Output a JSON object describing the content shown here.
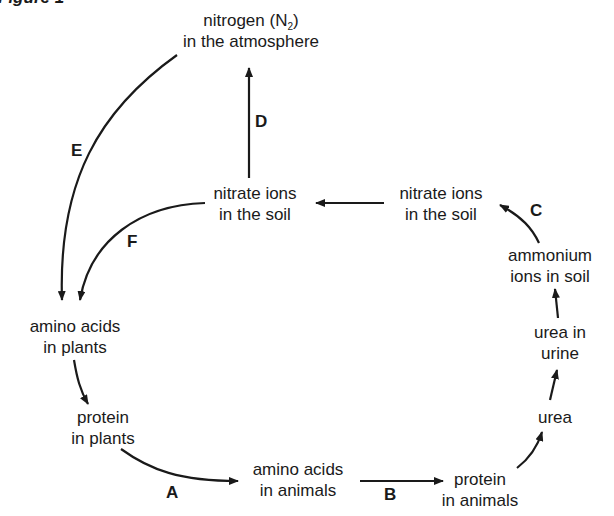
{
  "figure_title": "Figure 1",
  "nodes": {
    "nitrogen_l1": "nitrogen (N",
    "nitrogen_sub": "2",
    "nitrogen_close": ")",
    "nitrogen_l2": "in the atmosphere",
    "nitrate_left_l1": "nitrate ions",
    "nitrate_left_l2": "in the soil",
    "nitrate_right_l1": "nitrate ions",
    "nitrate_right_l2": "in the soil",
    "ammonium_l1": "ammonium",
    "ammonium_l2": "ions in soil",
    "urea_urine_l1": "urea in",
    "urea_urine_l2": "urine",
    "urea": "urea",
    "aa_plants_l1": "amino acids",
    "aa_plants_l2": "in plants",
    "prot_plants_l1": "protein",
    "prot_plants_l2": "in plants",
    "aa_animals_l1": "amino acids",
    "aa_animals_l2": "in animals",
    "prot_animals_l1": "protein",
    "prot_animals_l2": "in animals"
  },
  "process_labels": {
    "A": "A",
    "B": "B",
    "C": "C",
    "D": "D",
    "E": "E",
    "F": "F"
  },
  "colors": {
    "ink": "#1a1a1a",
    "background": "#ffffff"
  }
}
